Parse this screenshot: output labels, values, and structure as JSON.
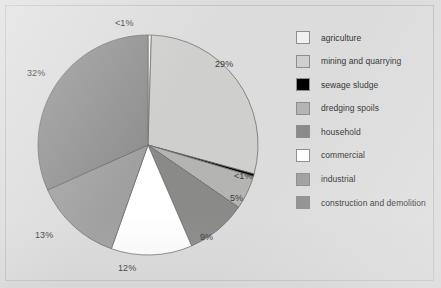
{
  "figure": {
    "background_color": "#dcdcdc",
    "frame_color": "#c2c2c2"
  },
  "chart_data": {
    "type": "pie",
    "title": "",
    "subtitle": "",
    "xlabel": "",
    "ylabel": "",
    "grid": false,
    "legend_position": "right",
    "start_angle_deg": 0,
    "direction": "clockwise",
    "categories": [
      "agriculture",
      "mining and quarrying",
      "sewage sludge",
      "dredging spoils",
      "household",
      "commercial",
      "industrial",
      "construction and demolition"
    ],
    "values": [
      0.5,
      29,
      0.4,
      5,
      9,
      12,
      13,
      32
    ],
    "labels": [
      "<1%",
      "29%",
      "<1%",
      "5%",
      "9%",
      "12%",
      "13%",
      "32%"
    ],
    "colors": [
      "#f0f0ee",
      "#cfcfcd",
      "#000000",
      "#b4b4b2",
      "#8a8a88",
      "#ffffff",
      "#a0a0a0",
      "#909090"
    ],
    "slices": [
      {
        "name": "agriculture",
        "value": 0.5,
        "label": "<1%",
        "color": "#f0f0ee"
      },
      {
        "name": "mining and quarrying",
        "value": 29,
        "label": "29%",
        "color": "#cfcfcd"
      },
      {
        "name": "sewage sludge",
        "value": 0.4,
        "label": "<1%",
        "color": "#000000"
      },
      {
        "name": "dredging spoils",
        "value": 5,
        "label": "5%",
        "color": "#b4b4b2"
      },
      {
        "name": "household",
        "value": 9,
        "label": "9%",
        "color": "#8a8a88"
      },
      {
        "name": "commercial",
        "value": 12,
        "label": "12%",
        "color": "#ffffff"
      },
      {
        "name": "industrial",
        "value": 13,
        "label": "13%",
        "color": "#a0a0a0"
      },
      {
        "name": "construction and demolition",
        "value": 32,
        "label": "32%",
        "color": "#909090"
      }
    ]
  },
  "pie_labels": {
    "agriculture": "<1%",
    "mining_and_quarrying": "29%",
    "sewage_sludge": "<1%",
    "dredging_spoils": "5%",
    "household": "9%",
    "commercial": "12%",
    "industrial": "13%",
    "construction_and_demolition": "32%"
  },
  "legend": {
    "items": [
      {
        "label": "agriculture",
        "color": "#f0f0ee"
      },
      {
        "label": "mining and quarrying",
        "color": "#cfcfcd"
      },
      {
        "label": "sewage sludge",
        "color": "#000000"
      },
      {
        "label": "dredging spoils",
        "color": "#b4b4b2"
      },
      {
        "label": "household",
        "color": "#8a8a88"
      },
      {
        "label": "commercial",
        "color": "#ffffff"
      },
      {
        "label": "industrial",
        "color": "#a0a0a0"
      },
      {
        "label": "construction and demolition",
        "color": "#909090"
      }
    ]
  }
}
